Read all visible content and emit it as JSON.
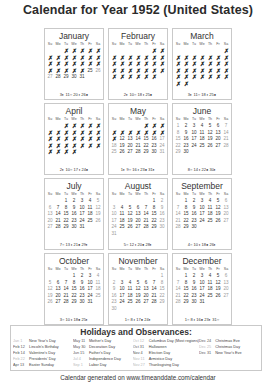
{
  "title": "Calendar for Year 1952 (United States)",
  "weekdays": [
    "Su",
    "Mo",
    "Tu",
    "We",
    "Th",
    "Fr",
    "Sa"
  ],
  "months": [
    {
      "name": "January",
      "offset": 2,
      "days": 31,
      "crossed_through": 24,
      "moons": "3◐ 11○ 20◑ 26●"
    },
    {
      "name": "February",
      "offset": 5,
      "days": 29,
      "crossed_through": 29,
      "moons": "2◐ 10○ 18◑ 25●"
    },
    {
      "name": "March",
      "offset": 6,
      "days": 31,
      "crossed_through": 31,
      "moons": "3◐ 11○ 18◑ 25●"
    },
    {
      "name": "April",
      "offset": 2,
      "days": 30,
      "crossed_through": 30,
      "moons": "2◐ 10○ 17◑ 24●"
    },
    {
      "name": "May",
      "offset": 4,
      "days": 31,
      "crossed_through": 11,
      "moons": "1◐ 9○ 16◑ 23● 31◐"
    },
    {
      "name": "June",
      "offset": 0,
      "days": 30,
      "crossed_through": 0,
      "moons": "8○ 14◑ 22● 30◐"
    },
    {
      "name": "July",
      "offset": 2,
      "days": 31,
      "crossed_through": 0,
      "moons": "7○ 13◑ 21● 29◐"
    },
    {
      "name": "August",
      "offset": 5,
      "days": 31,
      "crossed_through": 0,
      "moons": "5○ 12◑ 20● 28◐"
    },
    {
      "name": "September",
      "offset": 1,
      "days": 30,
      "crossed_through": 0,
      "moons": "4○ 10◑ 18● 26◐"
    },
    {
      "name": "October",
      "offset": 3,
      "days": 31,
      "crossed_through": 0,
      "moons": "3○ 10◑ 18● 25◐"
    },
    {
      "name": "November",
      "offset": 6,
      "days": 30,
      "crossed_through": 0,
      "moons": "1○ 8◑ 17● 24◐"
    },
    {
      "name": "December",
      "offset": 1,
      "days": 31,
      "crossed_through": 0,
      "moons": "1○ 8◑ 16● 23◐ 31○"
    }
  ],
  "holidays_title": "Holidays and Observances:",
  "holidays": [
    [
      {
        "date": "Jan 1",
        "name": "New Year's Day",
        "faint": true
      },
      {
        "date": "Feb 12",
        "name": "Lincoln's Birthday",
        "faint": false
      },
      {
        "date": "Feb 14",
        "name": "Valentine's Day",
        "faint": false
      },
      {
        "date": "Feb 22",
        "name": "Presidents' Day",
        "faint": true
      },
      {
        "date": "Apr 13",
        "name": "Easter Sunday",
        "faint": false
      }
    ],
    [
      {
        "date": "May 11",
        "name": "Mother's Day",
        "faint": false
      },
      {
        "date": "May 30",
        "name": "Decoration Day",
        "faint": false
      },
      {
        "date": "Jun 15",
        "name": "Father's Day",
        "faint": false
      },
      {
        "date": "Jul 4",
        "name": "Independence Day",
        "faint": true
      },
      {
        "date": "Sep 1",
        "name": "Labor Day",
        "faint": true
      }
    ],
    [
      {
        "date": "Oct 12",
        "name": "Columbus Day (Most regions)",
        "faint": true
      },
      {
        "date": "Oct 31",
        "name": "Halloween",
        "faint": false
      },
      {
        "date": "Nov 4",
        "name": "Election Day",
        "faint": false
      },
      {
        "date": "Nov 11",
        "name": "Armistice Day",
        "faint": true
      },
      {
        "date": "Nov 27",
        "name": "Thanksgiving Day",
        "faint": true
      }
    ],
    [
      {
        "date": "Dec 24",
        "name": "Christmas Eve",
        "faint": false
      },
      {
        "date": "Dec 25",
        "name": "Christmas Day",
        "faint": true
      },
      {
        "date": "Dec 31",
        "name": "New Year's Eve",
        "faint": false
      }
    ]
  ],
  "footer": "Calendar generated on www.timeanddate.com/calendar"
}
